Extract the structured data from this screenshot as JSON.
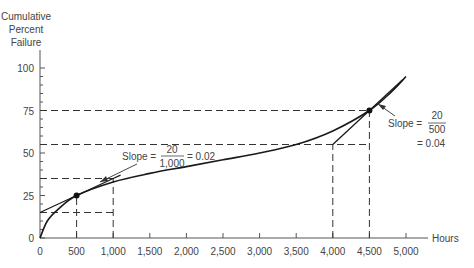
{
  "chart_data": {
    "type": "line",
    "title": "",
    "ylabel_lines": [
      "Cumulative",
      "Percent",
      "Failure"
    ],
    "xlabel": "Hours",
    "xlim": [
      0,
      5000
    ],
    "ylim": [
      0,
      100
    ],
    "grid": false,
    "x_ticks": [
      0,
      500,
      1000,
      1500,
      2000,
      2500,
      3000,
      3500,
      4000,
      4500,
      5000
    ],
    "x_tick_labels": [
      "0",
      "500",
      "1,000",
      "1,500",
      "2,000",
      "2,500",
      "3,000",
      "3,500",
      "4,000",
      "4,500",
      "5,000"
    ],
    "y_ticks": [
      0,
      25,
      50,
      75,
      100
    ],
    "y_tick_labels": [
      "0",
      "25",
      "50",
      "75",
      "100"
    ],
    "series": [
      {
        "name": "Cumulative percent failure curve",
        "x": [
          0,
          100,
          250,
          500,
          1000,
          1500,
          2000,
          2500,
          3000,
          3500,
          4000,
          4500,
          4800,
          5000
        ],
        "values": [
          0,
          10,
          17,
          25,
          33,
          38,
          42,
          46,
          50,
          55,
          63,
          75,
          86,
          95
        ]
      },
      {
        "name": "Tangent at 500 hours",
        "x": [
          0,
          1000,
          1100
        ],
        "values": [
          15,
          35,
          37
        ]
      },
      {
        "name": "Tangent at 4500 hours",
        "x": [
          4000,
          4500,
          4950
        ],
        "values": [
          55,
          75,
          93
        ]
      }
    ],
    "points": [
      {
        "x": 500,
        "y": 25
      },
      {
        "x": 4500,
        "y": 75
      }
    ],
    "reference_lines": {
      "horizontal": [
        {
          "y": 15,
          "x_from": 0,
          "x_to": 1000
        },
        {
          "y": 35,
          "x_from": 0,
          "x_to": 1000
        },
        {
          "y": 55,
          "x_from": 0,
          "x_to": 4500
        },
        {
          "y": 75,
          "x_from": 0,
          "x_to": 4500
        }
      ],
      "vertical": [
        {
          "x": 500,
          "y_from": 0,
          "y_to": 25
        },
        {
          "x": 1000,
          "y_from": 0,
          "y_to": 35
        },
        {
          "x": 4000,
          "y_from": 0,
          "y_to": 55
        },
        {
          "x": 4500,
          "y_from": 0,
          "y_to": 75
        }
      ]
    },
    "annotations": [
      {
        "text": "Slope = 20/1,000 = 0.02",
        "prefix": "Slope =",
        "numerator": "20",
        "denominator": "1,000",
        "result": "= 0.02",
        "points_to_x": 800
      },
      {
        "text": "Slope = 20/500 = 0.04",
        "prefix": "Slope =",
        "numerator": "20",
        "denominator": "500",
        "result": "= 0.04",
        "points_to_x": 4600
      }
    ]
  },
  "labels": {
    "ylabel": [
      "Cumulative",
      "Percent",
      "Failure"
    ],
    "xlabel": "Hours",
    "ann1": {
      "prefix": "Slope =",
      "num": "20",
      "den": "1,000",
      "result": "= 0.02"
    },
    "ann2": {
      "prefix": "Slope =",
      "num": "20",
      "den": "500",
      "result": "= 0.04"
    }
  }
}
